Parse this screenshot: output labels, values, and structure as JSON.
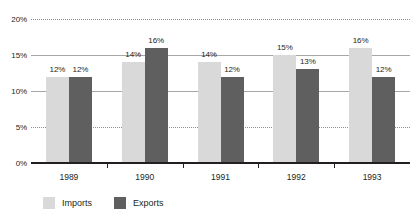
{
  "chart_data": {
    "type": "bar",
    "title": "",
    "subtitle": "",
    "xlabel": "",
    "ylabel": "",
    "categories": [
      "1989",
      "1990",
      "1991",
      "1992",
      "1993"
    ],
    "series": [
      {
        "name": "Imports",
        "color": "#d9d9d9",
        "values": [
          12,
          14,
          14,
          15,
          16
        ],
        "labels": [
          "12%",
          "14%",
          "14%",
          "15%",
          "16%"
        ]
      },
      {
        "name": "Exports",
        "color": "#5f5f5f",
        "values": [
          12,
          16,
          12,
          13,
          12
        ],
        "labels": [
          "12%",
          "16%",
          "12%",
          "13%",
          "12%"
        ]
      }
    ],
    "ylim": [
      0,
      20
    ],
    "yticks": [
      0,
      5,
      10,
      15,
      20
    ],
    "ytick_labels": [
      "0%",
      "5%",
      "10%",
      "15%",
      "20%"
    ],
    "grid": true,
    "grid_style": "dotted",
    "legend_position": "bottom-left"
  },
  "legend": {
    "items": [
      {
        "label": "Imports",
        "color": "#d9d9d9"
      },
      {
        "label": "Exports",
        "color": "#5f5f5f"
      }
    ]
  },
  "colors": {
    "imports": "#d9d9d9",
    "exports": "#5f5f5f",
    "axis": "#231f20",
    "grid": "#8d8d8d",
    "background": "#ffffff"
  }
}
